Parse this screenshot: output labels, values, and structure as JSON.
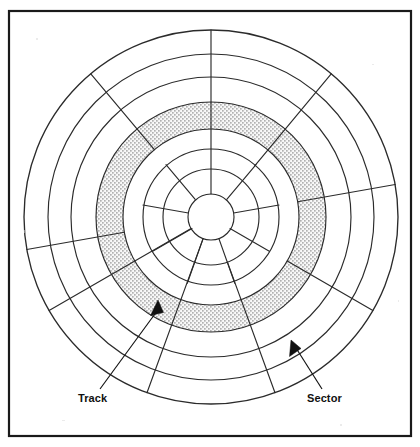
{
  "figure": {
    "background_color": "#ffffff",
    "line_color": "#2b2b2b",
    "frame_color": "#1a1a1a",
    "highlight_fill_color": "#9a9a9a",
    "highlight_pattern": "stipple-dots"
  },
  "frame": {
    "x": 8,
    "y": 10,
    "width": 404,
    "height": 427
  },
  "platter": {
    "center_x": 211,
    "center_y": 217,
    "outer_radius": 187,
    "hub_radius": 23,
    "track_count": 7,
    "sector_count": 9,
    "sector_angle_degrees": 40,
    "track_radii": [
      23,
      48,
      68,
      88,
      115,
      140,
      163,
      187
    ],
    "highlighted_track_index": 3,
    "highlighted_track_inner_radius": 88,
    "highlighted_track_outer_radius": 115,
    "spoke_start_angles_degrees": [
      0,
      40,
      80,
      120,
      160,
      200,
      240,
      280,
      320
    ],
    "spoke_inner_radii": [
      23,
      68,
      88,
      88,
      48,
      23,
      23,
      88,
      88
    ]
  },
  "callouts": [
    {
      "id": "track",
      "label": "Track",
      "label_x": 78,
      "label_y": 401,
      "leader_start_x": 100,
      "leader_start_y": 389,
      "leader_end_x": 158,
      "leader_end_y": 303,
      "arrow_tip_x": 158,
      "arrow_tip_y": 300,
      "arrow_angle_degrees": 56
    },
    {
      "id": "sector",
      "label": "Sector",
      "label_x": 307,
      "label_y": 401,
      "leader_start_x": 322,
      "leader_start_y": 389,
      "leader_end_x": 294,
      "leader_end_y": 345,
      "arrow_tip_x": 291,
      "arrow_tip_y": 340,
      "arrow_angle_degrees": 237
    }
  ]
}
